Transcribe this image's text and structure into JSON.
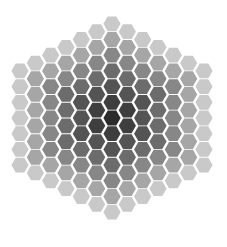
{
  "board": {
    "shape": "hexagon",
    "radius": 6,
    "cell_shape": "flat-top-hexagon",
    "columns": 13,
    "column_sizes": [
      7,
      8,
      9,
      10,
      11,
      12,
      13,
      12,
      11,
      10,
      9,
      8,
      7
    ],
    "center": {
      "x": 112,
      "y": 118
    },
    "column_step_x": 15.33,
    "row_step_y": 15.7,
    "hex_half_width": 8.6,
    "hex_half_height": 7.4,
    "ring_colors": [
      "#2c2c2c",
      "#3e3e3e",
      "#545454",
      "#6c6c6c",
      "#878787",
      "#a6a6a6",
      "#c9c9c9"
    ],
    "background": "#ffffff"
  }
}
